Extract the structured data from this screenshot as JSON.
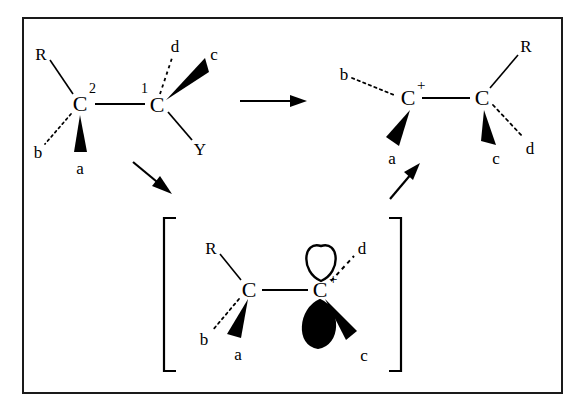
{
  "figure": {
    "domain_description": "Organic chemistry reaction mechanism: hydride/alkyl shift through a carbocation intermediate",
    "background_color": "#ffffff",
    "ink_color": "#000000",
    "frame_color": "#1a1a1a",
    "scan_noise_top_left": "· ·· ··· ··",
    "scan_noise_top_right": "···· ········ ·· ·····"
  },
  "structures": {
    "reactant": {
      "name": "starting-material",
      "atoms": {
        "c2": {
          "symbol": "C",
          "superscript_number": "2"
        },
        "c1": {
          "symbol": "C",
          "superscript_number": "1"
        }
      },
      "substituents": [
        {
          "label": "R",
          "bond": "plain",
          "on": "c2"
        },
        {
          "label": "b",
          "bond": "hashed",
          "on": "c2"
        },
        {
          "label": "a",
          "bond": "wedge",
          "on": "c2"
        },
        {
          "label": "d",
          "bond": "hashed",
          "on": "c1"
        },
        {
          "label": "c",
          "bond": "wedge",
          "on": "c1"
        },
        {
          "label": "Y",
          "bond": "plain",
          "on": "c1"
        }
      ]
    },
    "intermediate": {
      "name": "carbocation-intermediate",
      "bracketed": true,
      "atoms": {
        "left_c": {
          "symbol": "C",
          "charge": ""
        },
        "right_c": {
          "symbol": "C",
          "charge": "+"
        }
      },
      "orbital": {
        "name": "p-orbital",
        "upper_lobe": "hollow",
        "lower_lobe": "filled"
      },
      "substituents": [
        {
          "label": "R",
          "bond": "plain",
          "on": "left_c"
        },
        {
          "label": "b",
          "bond": "hashed",
          "on": "left_c"
        },
        {
          "label": "a",
          "bond": "wedge",
          "on": "left_c"
        },
        {
          "label": "d",
          "bond": "hashed",
          "on": "right_c"
        },
        {
          "label": "c",
          "bond": "wedge",
          "on": "right_c"
        }
      ]
    },
    "product": {
      "name": "rearranged-carbocation",
      "atoms": {
        "left_c": {
          "symbol": "C",
          "charge": "+"
        },
        "right_c": {
          "symbol": "C",
          "charge": ""
        }
      },
      "substituents": [
        {
          "label": "b",
          "bond": "hashed",
          "on": "left_c"
        },
        {
          "label": "a",
          "bond": "wedge",
          "on": "left_c"
        },
        {
          "label": "R",
          "bond": "plain",
          "on": "right_c"
        },
        {
          "label": "c",
          "bond": "wedge",
          "on": "right_c"
        },
        {
          "label": "d",
          "bond": "hashed",
          "on": "right_c"
        }
      ]
    }
  },
  "arrows": [
    {
      "name": "arrow-reactant-to-product",
      "direction": "right"
    },
    {
      "name": "arrow-reactant-to-intermediate",
      "direction": "down-right"
    },
    {
      "name": "arrow-intermediate-to-product",
      "direction": "up-right"
    }
  ],
  "labels": {
    "reactant": {
      "R": "R",
      "b": "b",
      "a": "a",
      "c2": "C",
      "sup2": "2",
      "sup1": "1",
      "c1": "C",
      "d": "d",
      "c": "c",
      "Y": "Y"
    },
    "product": {
      "b": "b",
      "c_plus": "C",
      "plus": "+",
      "a": "a",
      "R": "R",
      "c_right": "C",
      "c": "c",
      "d": "d"
    },
    "intermediate": {
      "R": "R",
      "b": "b",
      "a": "a",
      "c_left": "C",
      "c_right": "C",
      "plus": "+",
      "d": "d",
      "c": "c",
      "bracket_open": "[",
      "bracket_close": "]"
    }
  }
}
